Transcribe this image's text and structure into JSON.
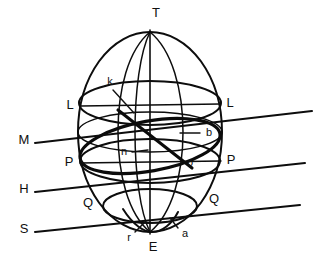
{
  "figure": {
    "background_color": "#ffffff",
    "ink_color": "#0d0d0d"
  },
  "labels": {
    "top_pole": "T",
    "bottom_pole": "E",
    "left_L": "L",
    "right_L": "L",
    "left_P": "P",
    "right_P": "P",
    "left_Q": "Q",
    "right_Q": "Q",
    "line_M": "M",
    "line_H": "H",
    "line_S": "S",
    "point_k": "k",
    "point_n": "n",
    "point_o": "o",
    "point_b": "b",
    "point_r": "r",
    "point_a": "a"
  },
  "geometry": {
    "center_x": 150,
    "center_y": 132,
    "semi_axis_x": 72,
    "semi_axis_y": 100,
    "top_vertex_y": 32,
    "bottom_vertex_y": 232,
    "circle_L_y": 103,
    "circle_P_y": 161,
    "circle_Q_y": 206,
    "oblique_line_M_y_left": 139,
    "oblique_line_H_y_left": 190,
    "oblique_line_S_y_left": 229
  }
}
